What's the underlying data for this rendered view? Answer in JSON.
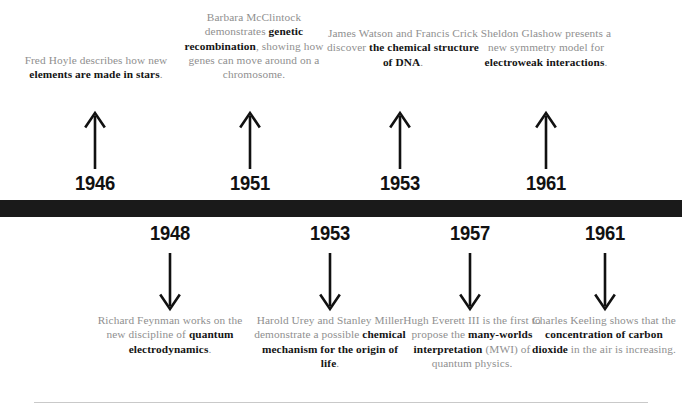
{
  "figure": {
    "kind": "timeline-infographic",
    "colors": {
      "bar": "#1a1a1a",
      "body_text": "#8f8f8f",
      "emphasis_text": "#141414",
      "year_text": "#111111",
      "rule": "#c9c9c9",
      "background": "#ffffff"
    }
  },
  "top_events": [
    {
      "year": "1946",
      "arrow": "arrow-up-icon",
      "text_runs": [
        {
          "t": "Fred Hoyle describes how new ",
          "bold": false
        },
        {
          "t": "elements are made in stars",
          "bold": true
        },
        {
          "t": ".",
          "bold": false
        }
      ],
      "plain_text": "Fred Hoyle describes how new elements are made in stars."
    },
    {
      "year": "1951",
      "arrow": "arrow-up-icon",
      "text_runs": [
        {
          "t": "Barbara McClintock demonstrates ",
          "bold": false
        },
        {
          "t": "genetic recombination",
          "bold": true
        },
        {
          "t": ", showing how genes can move around on a chromosome.",
          "bold": false
        }
      ],
      "plain_text": "Barbara McClintock demonstrates genetic recombination, showing how genes can move around on a chromosome."
    },
    {
      "year": "1953",
      "arrow": "arrow-up-icon",
      "text_runs": [
        {
          "t": "James Watson and Francis Crick discover ",
          "bold": false
        },
        {
          "t": "the chemical structure of DNA",
          "bold": true
        },
        {
          "t": ".",
          "bold": false
        }
      ],
      "plain_text": "James Watson and Francis Crick discover the chemical structure of DNA."
    },
    {
      "year": "1961",
      "arrow": "arrow-up-icon",
      "text_runs": [
        {
          "t": "Sheldon Glashow presents a new symmetry model for ",
          "bold": false
        },
        {
          "t": "electroweak interactions",
          "bold": true
        },
        {
          "t": ".",
          "bold": false
        }
      ],
      "plain_text": "Sheldon Glashow presents a new symmetry model for electroweak interactions."
    }
  ],
  "bottom_events": [
    {
      "year": "1948",
      "arrow": "arrow-down-icon",
      "text_runs": [
        {
          "t": "Richard Feynman works on the new discipline of ",
          "bold": false
        },
        {
          "t": "quantum electrodynamics",
          "bold": true
        },
        {
          "t": ".",
          "bold": false
        }
      ],
      "plain_text": "Richard Feynman works on the new discipline of quantum electrodynamics."
    },
    {
      "year": "1953",
      "arrow": "arrow-down-icon",
      "text_runs": [
        {
          "t": "Harold Urey and Stanley Miller demonstrate a possible ",
          "bold": false
        },
        {
          "t": "chemical mechanism for the origin of life",
          "bold": true
        },
        {
          "t": ".",
          "bold": false
        }
      ],
      "plain_text": "Harold Urey and Stanley Miller demonstrate a possible chemical mechanism for the origin of life."
    },
    {
      "year": "1957",
      "arrow": "arrow-down-icon",
      "text_runs": [
        {
          "t": "Hugh Everett III is the first to propose the ",
          "bold": false
        },
        {
          "t": "many-worlds interpretation",
          "bold": true
        },
        {
          "t": " (MWI) of quantum physics.",
          "bold": false
        }
      ],
      "plain_text": "Hugh Everett III is the first to propose the many-worlds interpretation (MWI) of quantum physics."
    },
    {
      "year": "1961",
      "arrow": "arrow-down-icon",
      "text_runs": [
        {
          "t": "Charles Keeling shows that the ",
          "bold": false
        },
        {
          "t": "concentration of carbon dioxide",
          "bold": true
        },
        {
          "t": " in the air is increasing.",
          "bold": false
        }
      ],
      "plain_text": "Charles Keeling shows that the concentration of carbon dioxide in the air is increasing."
    }
  ]
}
